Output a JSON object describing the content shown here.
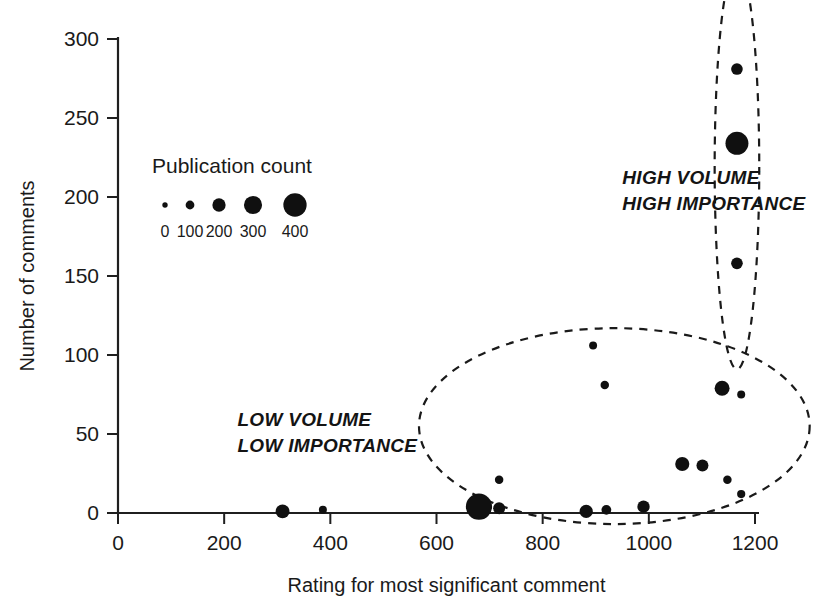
{
  "chart_data": {
    "type": "scatter",
    "title": "",
    "xlabel": "Rating for most significant comment",
    "ylabel": "Number of comments",
    "xlim": [
      0,
      1200
    ],
    "ylim": [
      0,
      300
    ],
    "xticks": [
      0,
      200,
      400,
      600,
      800,
      1000,
      1200
    ],
    "yticks": [
      0,
      50,
      100,
      150,
      200,
      250,
      300
    ],
    "xtick_labels": [
      "0",
      "200",
      "400",
      "600",
      "800",
      "1000",
      "1200"
    ],
    "ytick_labels": [
      "0",
      "50",
      "100",
      "150",
      "200",
      "250",
      "300"
    ],
    "grid": false,
    "size_encoding": "Publication count (bubble area)",
    "points": [
      {
        "x": 310,
        "y": 1,
        "size": 120
      },
      {
        "x": 386,
        "y": 2,
        "size": 40
      },
      {
        "x": 680,
        "y": 4,
        "size": 430
      },
      {
        "x": 718,
        "y": 3,
        "size": 90
      },
      {
        "x": 718,
        "y": 21,
        "size": 45
      },
      {
        "x": 882,
        "y": 1,
        "size": 110
      },
      {
        "x": 895,
        "y": 106,
        "size": 40
      },
      {
        "x": 917,
        "y": 81,
        "size": 45
      },
      {
        "x": 920,
        "y": 2,
        "size": 60
      },
      {
        "x": 990,
        "y": 4,
        "size": 95
      },
      {
        "x": 1063,
        "y": 31,
        "size": 125
      },
      {
        "x": 1101,
        "y": 30,
        "size": 90
      },
      {
        "x": 1138,
        "y": 79,
        "size": 140
      },
      {
        "x": 1148,
        "y": 21,
        "size": 45
      },
      {
        "x": 1174,
        "y": 75,
        "size": 40
      },
      {
        "x": 1174,
        "y": 12,
        "size": 42
      },
      {
        "x": 1166,
        "y": 281,
        "size": 85
      },
      {
        "x": 1166,
        "y": 234,
        "size": 330
      },
      {
        "x": 1166,
        "y": 158,
        "size": 85
      }
    ],
    "clusters": [
      {
        "id": "high-volume-high-importance",
        "label_lines": [
          "HIGH VOLUME",
          "HIGH IMPORTANCE"
        ],
        "label_x": 950,
        "label_y": 208,
        "ellipse": {
          "cx": 1166,
          "cy": 219,
          "rx": 42,
          "ry": 128,
          "rotation": 0
        }
      },
      {
        "id": "low-volume-low-importance",
        "label_lines": [
          "LOW VOLUME",
          "LOW IMPORTANCE"
        ],
        "label_x": 225,
        "label_y": 55,
        "ellipse": {
          "cx": 935,
          "cy": 55,
          "rx": 368,
          "ry": 62,
          "rotation": 0
        }
      }
    ],
    "legend": {
      "position": "inside-upper-left",
      "title": "Publication count",
      "entries": [
        {
          "label": "0",
          "value": 0,
          "size": 18
        },
        {
          "label": "100",
          "value": 100,
          "size": 48
        },
        {
          "label": "200",
          "value": 200,
          "size": 110
        },
        {
          "label": "300",
          "value": 300,
          "size": 205
        },
        {
          "label": "400",
          "value": 400,
          "size": 340
        }
      ]
    },
    "colors": {
      "marker": "#101010",
      "axis": "#1f1f1f",
      "text": "#1a1a1a",
      "background": "#ffffff",
      "cluster_outline": "#1a1a1a"
    }
  }
}
